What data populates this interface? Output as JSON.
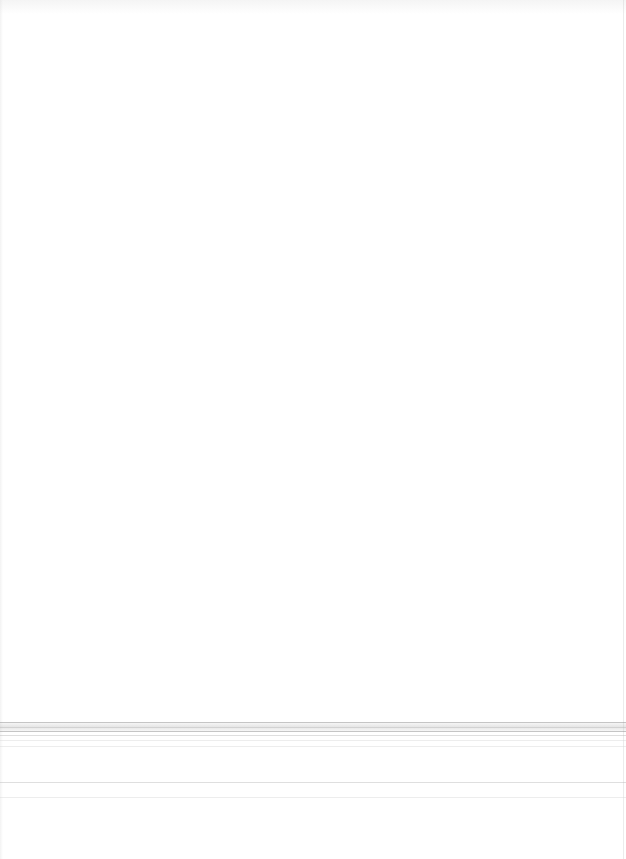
{
  "document": {
    "header_text": "",
    "body_text": "",
    "footer_text": ""
  },
  "rules": {
    "colors": {
      "dark": "#969696",
      "mid": "#b9b9b9",
      "light": "#d7d7d7"
    }
  }
}
